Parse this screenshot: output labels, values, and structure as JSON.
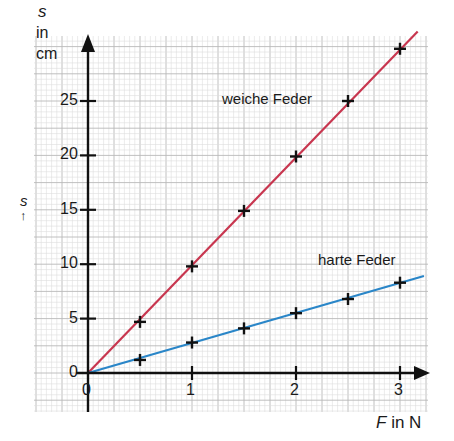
{
  "chart_data": {
    "type": "line",
    "title": "",
    "xlabel": "F in N",
    "xlabel_var": "F",
    "xlabel_unit": "in N",
    "ylabel": "s in cm",
    "ylabel_var": "s",
    "ylabel_unit_1": "in",
    "ylabel_unit_2": "cm",
    "side_label": "s",
    "side_arrow": "↑",
    "xlim": [
      0,
      3.2
    ],
    "ylim": [
      0,
      31
    ],
    "x_ticks": [
      0,
      1,
      2,
      3
    ],
    "y_ticks": [
      0,
      5,
      10,
      15,
      20,
      25
    ],
    "grid": true,
    "series": [
      {
        "name": "weiche Feder",
        "color": "#c8364f",
        "x": [
          0.5,
          1,
          1.5,
          2,
          2.5,
          3
        ],
        "values": [
          4.7,
          9.8,
          14.9,
          19.9,
          25.0,
          29.8
        ],
        "fit_slope": 9.9,
        "fit_end_x": 3.17
      },
      {
        "name": "harte Feder",
        "color": "#2a86c8",
        "x": [
          0.5,
          1,
          1.5,
          2,
          2.5,
          3
        ],
        "values": [
          1.2,
          2.8,
          4.1,
          5.5,
          6.8,
          8.3
        ],
        "fit_slope": 2.76,
        "fit_end_x": 3.23
      }
    ],
    "annotations": [
      {
        "text": "weiche Feder",
        "series": 0
      },
      {
        "text": "harte Feder",
        "series": 1
      }
    ]
  },
  "labels": {
    "weich": "weiche Feder",
    "hart": "harte Feder"
  }
}
